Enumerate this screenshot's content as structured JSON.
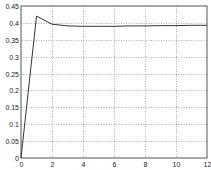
{
  "chart_data": {
    "type": "line",
    "title": "",
    "xlabel": "",
    "ylabel": "",
    "xlim": [
      0,
      12
    ],
    "ylim": [
      0,
      0.45
    ],
    "grid": true,
    "x_ticks": [
      0,
      2,
      4,
      6,
      8,
      10,
      12
    ],
    "x_tick_labels": [
      "0",
      "2",
      "4",
      "6",
      "8",
      "10",
      "12"
    ],
    "y_ticks": [
      0,
      0.05,
      0.1,
      0.15,
      0.2,
      0.25,
      0.3,
      0.35,
      0.4,
      0.45
    ],
    "y_tick_labels": [
      "0",
      "0.05",
      "0.1",
      "0.15",
      "0.2",
      "0.25",
      "0.3",
      "0.35",
      "0.4",
      "0.45"
    ],
    "series": [
      {
        "name": "response",
        "color": "#333333",
        "x": [
          0,
          1,
          2,
          3,
          4,
          5,
          6,
          7,
          8,
          9,
          10,
          11,
          12
        ],
        "values": [
          0,
          0.42,
          0.396,
          0.391,
          0.39,
          0.39,
          0.39,
          0.391,
          0.391,
          0.392,
          0.392,
          0.393,
          0.393
        ]
      }
    ],
    "legend": null
  },
  "colors": {
    "axis": "#555555",
    "grid": "#777777",
    "line": "#333333",
    "background": "#ffffff"
  }
}
